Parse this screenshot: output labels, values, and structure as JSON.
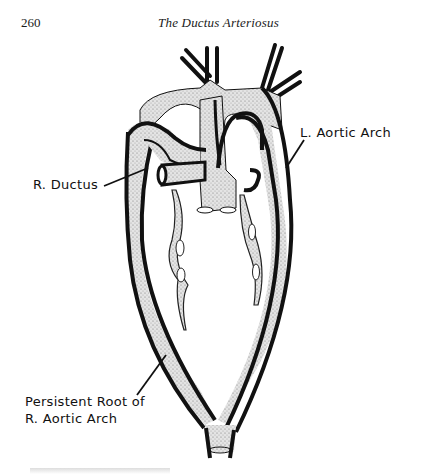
{
  "page": {
    "number": "260",
    "running_head": "The Ductus Arteriosus"
  },
  "figure": {
    "labels": {
      "r_ductus": "R. Ductus",
      "l_aortic_arch": "L. Aortic Arch",
      "persistent_root_line1": "Persistent Root of",
      "persistent_root_line2": "R. Aortic Arch"
    },
    "colors": {
      "outline": "#111111",
      "vessel_fill": "#d9d9d9",
      "background": "#ffffff"
    }
  }
}
